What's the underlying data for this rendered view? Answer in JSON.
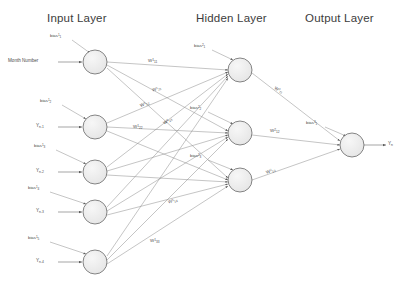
{
  "figure": {
    "type": "neural-network-diagram",
    "background": "#ffffff",
    "line_color": "#777777",
    "node_fill": "#ececec",
    "node_stroke": "#555555"
  },
  "titles": {
    "input": "Input Layer",
    "hidden": "Hidden Layer",
    "output": "Output Layer"
  },
  "input_layer": {
    "count": 5,
    "nodes": [
      {
        "label": "Month Number",
        "bias": "bias",
        "bias_sup": "1",
        "bias_sub": "1"
      },
      {
        "label": "Y",
        "label_sub": "n-1",
        "bias": "bias",
        "bias_sup": "1",
        "bias_sub": "2"
      },
      {
        "label": "Y",
        "label_sub": "n-2",
        "bias": "bias",
        "bias_sup": "1",
        "bias_sub": "3"
      },
      {
        "label": "Y",
        "label_sub": "n-3",
        "bias": "bias",
        "bias_sup": "1",
        "bias_sub": "4"
      },
      {
        "label": "Y",
        "label_sub": "n-4",
        "bias": "bias",
        "bias_sup": "1",
        "bias_sub": "5"
      }
    ]
  },
  "hidden_layer": {
    "count": 3,
    "nodes": [
      {
        "bias": "bias",
        "bias_sup": "2",
        "bias_sub": "1"
      },
      {
        "bias": "bias",
        "bias_sup": "2",
        "bias_sub": "2"
      },
      {
        "bias": "bias",
        "bias_sup": "2",
        "bias_sub": "3"
      }
    ]
  },
  "output_layer": {
    "count": 1,
    "nodes": [
      {
        "bias": "bias",
        "bias_sup": "3",
        "bias_sub": "1"
      }
    ],
    "output_label": "Y",
    "output_label_sub": "n"
  },
  "weights_layer1": [
    {
      "sym": "W",
      "sup": "1",
      "sub": "11"
    },
    {
      "sym": "W",
      "sup": "1",
      "sub": "21"
    },
    {
      "sym": "W",
      "sup": "1",
      "sub": "12"
    },
    {
      "sym": "W",
      "sup": "1",
      "sub": "22"
    },
    {
      "sym": "W",
      "sup": "1",
      "sub": "23"
    },
    {
      "sym": "W",
      "sup": "1",
      "sub": "14"
    },
    {
      "sym": "W",
      "sup": "1",
      "sub": "33"
    }
  ],
  "weights_layer2": [
    {
      "sym": "W",
      "sup": "2",
      "sub": "11"
    },
    {
      "sym": "W",
      "sup": "2",
      "sub": "12"
    },
    {
      "sym": "W",
      "sup": "2",
      "sub": "13"
    }
  ]
}
